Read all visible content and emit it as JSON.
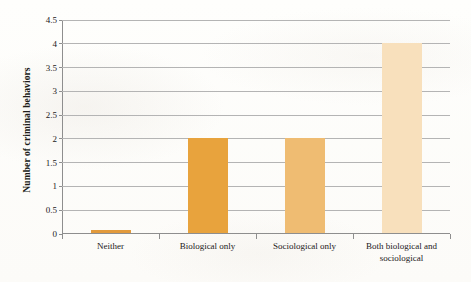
{
  "chart_data": {
    "type": "bar",
    "title": "",
    "xlabel": "",
    "ylabel": "Number of criminal behaviors",
    "categories": [
      "Neither",
      "Biological only",
      "Sociological only",
      "Both biological and sociological"
    ],
    "values": [
      0.05,
      2,
      2,
      4
    ],
    "bar_colors": [
      "#E29A3C",
      "#E8A33D",
      "#EFBC72",
      "#F8E0BC"
    ],
    "ylim": [
      0,
      4.5
    ],
    "ytick_labels": [
      "0",
      "0.5",
      "1",
      "1.5",
      "2",
      "2.5",
      "3",
      "3.5",
      "4",
      "4.5"
    ],
    "ytick_values": [
      0,
      0.5,
      1,
      1.5,
      2,
      2.5,
      3,
      3.5,
      4,
      4.5
    ],
    "grid": true,
    "legend": "none",
    "background_color": "#fdfdfb",
    "gridline_color": "#b4b4b4",
    "axis_color": "#8e8e8e",
    "text_color": "#232019"
  }
}
